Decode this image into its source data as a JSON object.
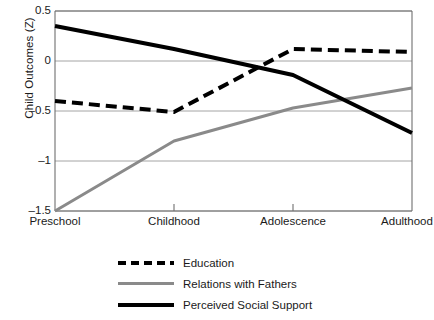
{
  "chart_data": {
    "type": "line",
    "title": "",
    "xlabel": "",
    "ylabel": "Child Outcomes (Z)",
    "categories": [
      "Preschool",
      "Childhood",
      "Adolescence",
      "Adulthood"
    ],
    "ylim": [
      -1.5,
      0.5
    ],
    "yticks": [
      0.5,
      0,
      -0.5,
      -1,
      -1.5
    ],
    "ytick_labels": [
      "0.5",
      "0",
      "–0.5",
      "–1",
      "–1.5"
    ],
    "grid": true,
    "grid_axis": "y",
    "legend_position": "bottom",
    "series": [
      {
        "name": "Education",
        "values": [
          -0.4,
          -0.51,
          0.12,
          0.09
        ],
        "style": "dashed",
        "color": "#000000",
        "width": 4
      },
      {
        "name": "Relations with Fathers",
        "values": [
          -1.5,
          -0.8,
          -0.47,
          -0.27
        ],
        "style": "solid",
        "color": "#8a8a8a",
        "width": 3
      },
      {
        "name": "Perceived Social Support",
        "values": [
          0.35,
          0.12,
          -0.14,
          -0.72
        ],
        "style": "solid",
        "color": "#000000",
        "width": 4
      }
    ]
  },
  "legend": {
    "items": [
      {
        "label": "Education",
        "swatch": "dashed-black-line-icon"
      },
      {
        "label": "Relations with Fathers",
        "swatch": "solid-gray-line-icon"
      },
      {
        "label": "Perceived Social Support",
        "swatch": "solid-black-line-icon"
      }
    ]
  },
  "axes": {
    "y_title": "Child Outcomes (Z)",
    "y_tick_labels": [
      "0.5",
      "0",
      "–0.5",
      "–1",
      "–1.5"
    ],
    "x_tick_labels": [
      "Preschool",
      "Childhood",
      "Adolescence",
      "Adulthood"
    ]
  },
  "colors": {
    "series_black": "#000000",
    "series_gray": "#8a8a8a",
    "grid": "#9a9a9a",
    "axis": "#6f6f6f",
    "background": "#ffffff",
    "text": "#1a1a1a"
  }
}
